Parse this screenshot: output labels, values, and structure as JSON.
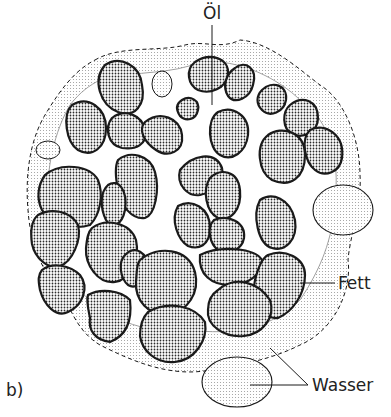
{
  "figure": {
    "panel_label": "b)",
    "labels": {
      "oil": "Öl",
      "fat": "Fett",
      "water": "Wasser"
    },
    "colors": {
      "line": "#1a1a1a",
      "particle_dot": "#2a2a2a",
      "fat_dot": "#9a9a9a",
      "background": "#ffffff"
    },
    "components": [
      {
        "name": "oil",
        "description": "white continuous oil phase between particles"
      },
      {
        "name": "fat",
        "description": "dark densely-dotted solid fat particles with thick outlines"
      },
      {
        "name": "water",
        "description": "lightly dotted ellipses of water droplets and outer fat/water film with dashed border"
      }
    ]
  }
}
